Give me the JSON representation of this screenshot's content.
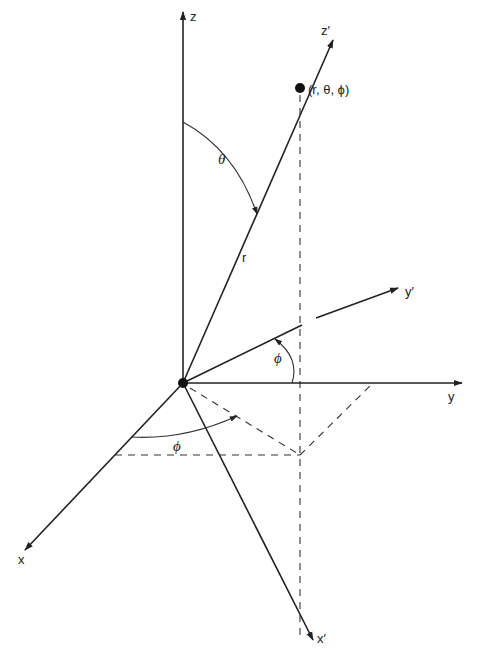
{
  "diagram": {
    "colors": {
      "ink": "#222222",
      "background": "#ffffff"
    },
    "axes": {
      "z": "z",
      "z_prime": "z′",
      "y": "y",
      "y_prime": "y′",
      "x": "x",
      "x_prime": "x′"
    },
    "point_label": "(r, θ, ϕ)",
    "radius_label": "r",
    "polar_angle_label": "θ",
    "azimuth_label_upper": "ϕ",
    "azimuth_label_lower": "ϕ"
  }
}
